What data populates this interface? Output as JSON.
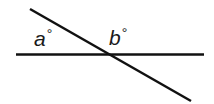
{
  "diagram": {
    "type": "intersecting-lines",
    "stroke_color": "#111111",
    "stroke_width": 2.4,
    "lines": [
      {
        "id": "horizontal",
        "x1": 16,
        "y1": 54.5,
        "x2": 204,
        "y2": 54.5
      },
      {
        "id": "transversal",
        "x1": 30,
        "y1": 9,
        "x2": 191,
        "y2": 101
      }
    ],
    "labels": [
      {
        "id": "a",
        "letter": "a",
        "degree": "°"
      },
      {
        "id": "b",
        "letter": "b",
        "degree": "°"
      }
    ]
  }
}
